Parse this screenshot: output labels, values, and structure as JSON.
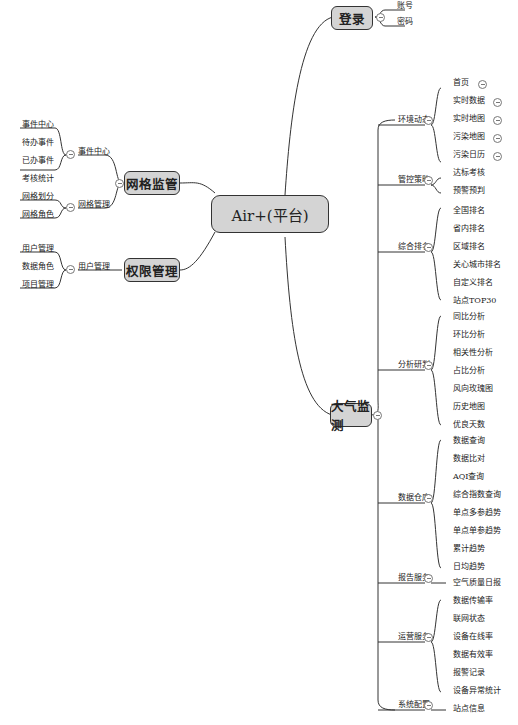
{
  "root": {
    "label": "Air+(平台)"
  },
  "right": {
    "login": {
      "label": "登录",
      "children": [
        "账号",
        "密码"
      ]
    },
    "air_monitor": {
      "label": "大气监测",
      "groups": [
        {
          "label": "环境动态",
          "children": [
            "首页",
            "实时数据",
            "实时地图",
            "污染地图",
            "污染日历"
          ]
        },
        {
          "label": "管控策略",
          "children": [
            "达标考核",
            "预警预判"
          ]
        },
        {
          "label": "综合排名",
          "children": [
            "全国排名",
            "省内排名",
            "区域排名",
            "关心城市排名",
            "自定义排名",
            "站点TOP30"
          ]
        },
        {
          "label": "分析研判",
          "children": [
            "同比分析",
            "环比分析",
            "相关性分析",
            "占比分析",
            "风向玫瑰图",
            "历史地图",
            "优良天数"
          ]
        },
        {
          "label": "数据仓库",
          "children": [
            "数据查询",
            "数据比对",
            "AQI查询",
            "综合指数查询",
            "单点多参趋势",
            "单点单参趋势",
            "累计趋势",
            "日均趋势"
          ]
        },
        {
          "label": "报告服务",
          "children": [
            "空气质量日报"
          ]
        },
        {
          "label": "运营服务",
          "children": [
            "数据传输率",
            "联网状态",
            "设备在线率",
            "数据有效率",
            "报警记录",
            "设备异常统计"
          ]
        },
        {
          "label": "系统配置",
          "children": [
            "站点信息"
          ]
        }
      ]
    }
  },
  "left": {
    "grid_supervision": {
      "label": "网格监管",
      "groups": [
        {
          "label": "事件中心",
          "children": [
            "事件中心",
            "待办事件",
            "已办事件",
            "考核统计"
          ]
        },
        {
          "label": "网格管理",
          "children": [
            "网格划分",
            "网格角色"
          ]
        }
      ]
    },
    "permission": {
      "label": "权限管理",
      "groups": [
        {
          "label": "用户管理",
          "children": [
            "用户管理",
            "数据角色",
            "项目管理"
          ]
        }
      ]
    }
  },
  "colors": {
    "box_fill": "#d4d4d4",
    "box_border": "#333333",
    "line": "#333333"
  }
}
